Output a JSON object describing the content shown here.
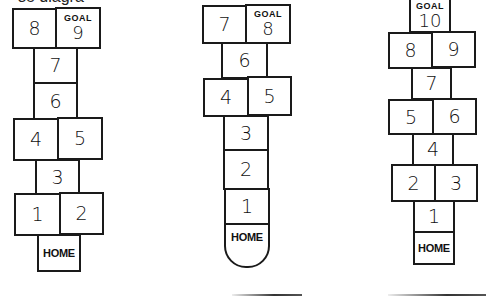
{
  "caption_fragment": "se diagra",
  "diagrams": [
    {
      "id": "left",
      "goal_label": "GOAL",
      "cells": {
        "c8": "8",
        "c9": "9",
        "c7": "7",
        "c6": "6",
        "c4": "4",
        "c5": "5",
        "c3": "3",
        "c1": "1",
        "c2": "2",
        "home": "HOME"
      }
    },
    {
      "id": "middle",
      "goal_label": "GOAL",
      "cells": {
        "c7": "7",
        "c8": "8",
        "c6": "6",
        "c4": "4",
        "c5": "5",
        "c3": "3",
        "c2": "2",
        "c1": "1",
        "home": "HOME"
      }
    },
    {
      "id": "right",
      "goal_label": "GOAL",
      "cells": {
        "c10": "10",
        "c8": "8",
        "c9": "9",
        "c7": "7",
        "c5": "5",
        "c6": "6",
        "c4": "4",
        "c2": "2",
        "c3": "3",
        "c1": "1",
        "home": "HOME"
      }
    }
  ]
}
